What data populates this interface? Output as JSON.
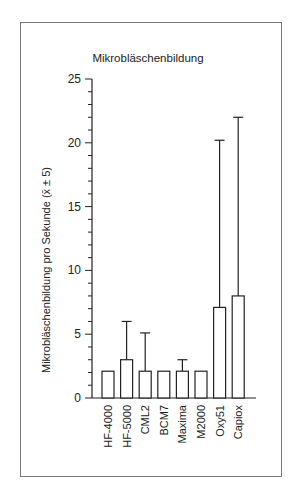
{
  "chart_data": {
    "type": "bar",
    "title": "Mikrobläschenbildung",
    "xlabel": "",
    "ylabel": "Mikrobläschenbildung pro Sekunde (x̄ ± 5)",
    "ylim": [
      0,
      25
    ],
    "yticks": [
      0,
      5,
      10,
      15,
      20,
      25
    ],
    "minor_tick_step": 1,
    "grid": false,
    "legend": null,
    "categories": [
      "HF-4000",
      "HF-5000",
      "CML2",
      "BCM7",
      "Maxima",
      "M2000",
      "Oxy51",
      "Capiox"
    ],
    "values": [
      2.1,
      3.0,
      2.1,
      2.1,
      2.1,
      2.1,
      7.1,
      8.0
    ],
    "error_upper": [
      null,
      6.0,
      5.1,
      null,
      3.0,
      null,
      20.2,
      22.0
    ],
    "bar_fill": "#ffffff",
    "bar_stroke": "#222222"
  }
}
